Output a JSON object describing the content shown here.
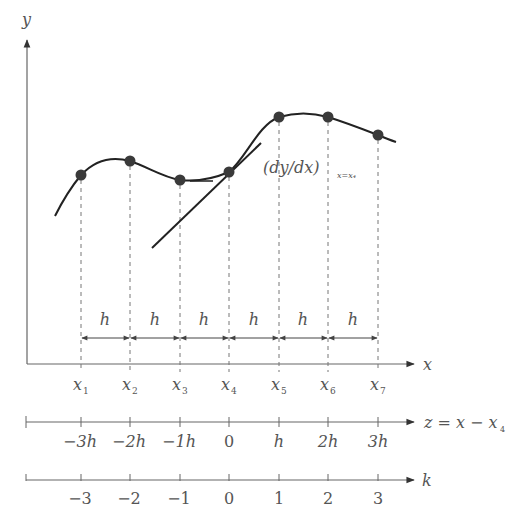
{
  "diagram": {
    "axes": {
      "y_label": "y",
      "x_label": "x"
    },
    "curve_annotation": {
      "main": "(dy/dx)",
      "subscript": "x=x₄"
    },
    "spacing_label": "h",
    "spacing_labels": [
      "h",
      "h",
      "h",
      "h",
      "h",
      "h"
    ],
    "x_points": [
      {
        "name": "x",
        "sub": "1"
      },
      {
        "name": "x",
        "sub": "2"
      },
      {
        "name": "x",
        "sub": "3"
      },
      {
        "name": "x",
        "sub": "4"
      },
      {
        "name": "x",
        "sub": "5"
      },
      {
        "name": "x",
        "sub": "6"
      },
      {
        "name": "x",
        "sub": "7"
      }
    ],
    "z_axis": {
      "label": "z = x − x",
      "label_sub": "4",
      "ticks": [
        "−3h",
        "−2h",
        "−1h",
        "0",
        "h",
        "2h",
        "3h"
      ]
    },
    "k_axis": {
      "label": "k",
      "ticks": [
        "−3",
        "−2",
        "−1",
        "0",
        "1",
        "2",
        "3"
      ]
    },
    "colors": {
      "curve": "#222222",
      "points": "#3a3a3a",
      "axis": "#666666",
      "text": "#555555",
      "dashed": "#777777"
    }
  }
}
